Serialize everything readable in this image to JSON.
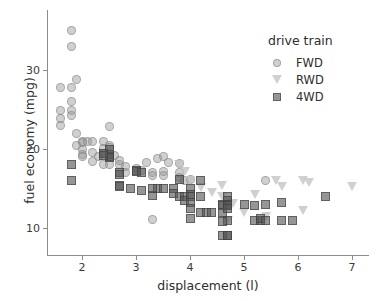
{
  "chart_data": {
    "type": "scatter",
    "title": "",
    "xlabel": "displacement (l)",
    "ylabel": "fuel economy (mpg)",
    "xlim": [
      1.4,
      7.3
    ],
    "ylim": [
      7.5,
      36.5
    ],
    "xticks": [
      2,
      3,
      4,
      5,
      6,
      7
    ],
    "yticks": [
      10,
      20,
      30
    ],
    "grid": false,
    "legend_position": "top-right",
    "legend_title": "drive train",
    "series": [
      {
        "name": "FWD",
        "marker": "circle",
        "color": "#969696",
        "points": [
          [
            1.8,
            35.0
          ],
          [
            1.8,
            33.0
          ],
          [
            1.6,
            27.8
          ],
          [
            1.8,
            27.8
          ],
          [
            1.9,
            28.8
          ],
          [
            1.6,
            24.9
          ],
          [
            1.6,
            23.9
          ],
          [
            1.8,
            26.0
          ],
          [
            1.8,
            24.9
          ],
          [
            1.6,
            23.0
          ],
          [
            1.8,
            24.2
          ],
          [
            1.9,
            21.9
          ],
          [
            2.0,
            21.0
          ],
          [
            2.0,
            20.8
          ],
          [
            1.9,
            20.5
          ],
          [
            2.0,
            20.0
          ],
          [
            2.0,
            19.3
          ],
          [
            2.0,
            19.0
          ],
          [
            2.1,
            20.9
          ],
          [
            2.2,
            20.9
          ],
          [
            2.4,
            21.0
          ],
          [
            2.4,
            20.1
          ],
          [
            2.5,
            22.8
          ],
          [
            2.5,
            20.4
          ],
          [
            2.5,
            20.2
          ],
          [
            2.4,
            19.4
          ],
          [
            2.5,
            19.0
          ],
          [
            2.2,
            19.6
          ],
          [
            2.3,
            19.0
          ],
          [
            2.2,
            18.4
          ],
          [
            2.4,
            18.1
          ],
          [
            2.7,
            18.0
          ],
          [
            2.8,
            17.8
          ],
          [
            2.8,
            17.0
          ],
          [
            3.0,
            17.5
          ],
          [
            3.1,
            17.3
          ],
          [
            3.3,
            17.0
          ],
          [
            3.3,
            11.1
          ],
          [
            3.3,
            16.6
          ],
          [
            3.5,
            19.1
          ],
          [
            3.5,
            17.2
          ],
          [
            3.5,
            16.6
          ],
          [
            3.6,
            18.3
          ],
          [
            3.8,
            17.0
          ],
          [
            3.8,
            16.4
          ],
          [
            3.8,
            18.2
          ],
          [
            3.9,
            16.0
          ],
          [
            4.0,
            16.2
          ],
          [
            3.4,
            18.8
          ],
          [
            3.2,
            18.3
          ],
          [
            2.7,
            18.6
          ],
          [
            2.6,
            19.2
          ],
          [
            2.5,
            18.0
          ],
          [
            5.4,
            16.0
          ]
        ]
      },
      {
        "name": "RWD",
        "marker": "triangle-down",
        "color": "#c8c8c8",
        "points": [
          [
            3.8,
            18.1
          ],
          [
            3.9,
            17.2
          ],
          [
            4.0,
            16.0
          ],
          [
            4.2,
            15.1
          ],
          [
            4.4,
            14.5
          ],
          [
            4.6,
            15.4
          ],
          [
            4.6,
            14.0
          ],
          [
            4.7,
            13.0
          ],
          [
            4.7,
            11.0
          ],
          [
            5.0,
            12.0
          ],
          [
            5.2,
            14.2
          ],
          [
            5.3,
            11.0
          ],
          [
            5.4,
            11.5
          ],
          [
            5.6,
            16.0
          ],
          [
            5.7,
            15.2
          ],
          [
            6.1,
            16.0
          ],
          [
            6.2,
            15.8
          ],
          [
            6.1,
            12.2
          ],
          [
            7.0,
            15.2
          ],
          [
            4.8,
            13.1
          ]
        ]
      },
      {
        "name": "4WD",
        "marker": "square",
        "color": "#555555",
        "points": [
          [
            1.8,
            18.0
          ],
          [
            1.8,
            16.0
          ],
          [
            2.5,
            19.3
          ],
          [
            2.5,
            19.0
          ],
          [
            2.5,
            18.9
          ],
          [
            2.5,
            20.0
          ],
          [
            2.4,
            19.4
          ],
          [
            2.4,
            19.2
          ],
          [
            2.7,
            17.0
          ],
          [
            2.7,
            16.8
          ],
          [
            2.7,
            15.4
          ],
          [
            2.7,
            15.2
          ],
          [
            2.9,
            15.0
          ],
          [
            3.0,
            17.3
          ],
          [
            3.0,
            17.2
          ],
          [
            3.1,
            17.0
          ],
          [
            3.1,
            14.8
          ],
          [
            3.3,
            14.1
          ],
          [
            3.4,
            15.0
          ],
          [
            3.7,
            15.0
          ],
          [
            3.7,
            14.4
          ],
          [
            3.8,
            16.2
          ],
          [
            3.8,
            14.0
          ],
          [
            3.9,
            14.0
          ],
          [
            3.9,
            13.5
          ],
          [
            4.0,
            15.0
          ],
          [
            4.0,
            14.3
          ],
          [
            4.0,
            14.0
          ],
          [
            4.0,
            13.2
          ],
          [
            4.0,
            12.5
          ],
          [
            4.0,
            11.2
          ],
          [
            4.2,
            16.0
          ],
          [
            4.2,
            14.0
          ],
          [
            4.2,
            12.0
          ],
          [
            4.3,
            12.0
          ],
          [
            4.6,
            13.0
          ],
          [
            4.6,
            12.8
          ],
          [
            4.6,
            12.0
          ],
          [
            4.7,
            14.0
          ],
          [
            4.7,
            13.5
          ],
          [
            4.7,
            13.0
          ],
          [
            4.7,
            12.8
          ],
          [
            4.7,
            12.5
          ],
          [
            4.7,
            11.0
          ],
          [
            4.6,
            9.0
          ],
          [
            4.7,
            9.1
          ],
          [
            4.7,
            9.0
          ],
          [
            5.0,
            13.0
          ],
          [
            5.2,
            12.8
          ],
          [
            5.2,
            11.0
          ],
          [
            5.3,
            11.0
          ],
          [
            5.3,
            11.2
          ],
          [
            5.4,
            13.0
          ],
          [
            5.4,
            11.0
          ],
          [
            5.7,
            13.2
          ],
          [
            5.7,
            11.0
          ],
          [
            5.9,
            11.0
          ],
          [
            6.5,
            14.0
          ],
          [
            4.6,
            10.8
          ],
          [
            4.4,
            12.0
          ],
          [
            3.3,
            15.0
          ],
          [
            3.5,
            15.0
          ]
        ]
      }
    ]
  },
  "legend": {
    "title": "drive train",
    "items": [
      {
        "label": "FWD",
        "marker": "circle-marker-icon"
      },
      {
        "label": "RWD",
        "marker": "triangle-down-marker-icon"
      },
      {
        "label": "4WD",
        "marker": "square-marker-icon"
      }
    ]
  },
  "axes": {
    "x_title": "displacement (l)",
    "y_title": "fuel economy (mpg)",
    "x_tick_labels": [
      "2",
      "3",
      "4",
      "5",
      "6",
      "7"
    ],
    "y_tick_labels": [
      "10",
      "20",
      "30"
    ]
  }
}
